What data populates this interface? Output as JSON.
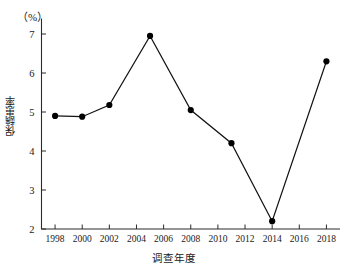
{
  "chart_data": {
    "type": "line",
    "title": "",
    "subtitle": "",
    "unit_label": "（%）",
    "xlabel": "调查年度",
    "ylabel": "保龋患率",
    "xlim": [
      1997,
      2019
    ],
    "ylim": [
      2,
      7.4
    ],
    "grid": false,
    "legend": null,
    "x_ticks": [
      "1998",
      "2000",
      "2002",
      "2004",
      "2006",
      "2008",
      "2010",
      "2012",
      "2014",
      "2016",
      "2018"
    ],
    "x_tick_values": [
      1998,
      2000,
      2002,
      2004,
      2006,
      2008,
      2010,
      2012,
      2014,
      2016,
      2018
    ],
    "y_ticks": [
      "2",
      "3",
      "4",
      "5",
      "6",
      "7"
    ],
    "y_tick_values": [
      2,
      3,
      4,
      5,
      6,
      7
    ],
    "x": [
      1998,
      2000,
      2002,
      2005,
      2008,
      2011,
      2014,
      2018
    ],
    "values": [
      4.9,
      4.88,
      5.18,
      6.95,
      5.05,
      4.2,
      2.2,
      6.3
    ],
    "series": [
      {
        "name": "保龋患率",
        "marker": "circle",
        "color": "#000000",
        "points": [
          {
            "x": 1998,
            "y": 4.9
          },
          {
            "x": 2000,
            "y": 4.88
          },
          {
            "x": 2002,
            "y": 5.18
          },
          {
            "x": 2005,
            "y": 6.95
          },
          {
            "x": 2008,
            "y": 5.05
          },
          {
            "x": 2011,
            "y": 4.2
          },
          {
            "x": 2014,
            "y": 2.2
          },
          {
            "x": 2018,
            "y": 6.3
          }
        ]
      }
    ]
  }
}
